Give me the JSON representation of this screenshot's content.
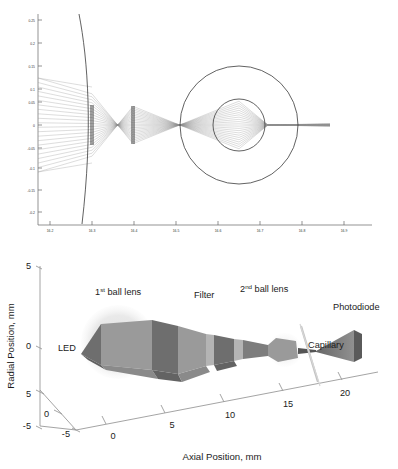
{
  "figure": {
    "name": "optical-ray-trace-and-3d-beam-layout",
    "background": "#ffffff"
  },
  "chart_data": [
    {
      "id": "ray-trace",
      "type": "line",
      "title": "",
      "xlabel": "",
      "ylabel": "",
      "xlim": [
        16.15,
        16.95
      ],
      "ylim": [
        -0.235,
        0.268
      ],
      "grid": false,
      "legend": null,
      "xticks": [
        "16.2",
        "16.3",
        "16.4",
        "16.5",
        "16.6",
        "16.7",
        "16.8",
        "16.9"
      ],
      "xtick_values": [
        16.2,
        16.3,
        16.4,
        16.5,
        16.6,
        16.7,
        16.8,
        16.9
      ],
      "yticks": [
        "0.25",
        "0.2",
        "0.15",
        "0.1",
        "0.05",
        "0",
        "-0.05",
        "-0.1",
        "-0.15",
        "-0.2"
      ],
      "ytick_values": [
        0.25,
        0.2,
        0.15,
        0.1,
        0.05,
        0,
        -0.05,
        -0.1,
        -0.15,
        -0.2
      ],
      "elements": [
        {
          "name": "first-ball-lens-arc",
          "kind": "arc",
          "center_x": 16.12,
          "center_y": 0.0,
          "radius": 0.175
        },
        {
          "name": "aperture-1",
          "kind": "vertical-stop",
          "x": 16.3,
          "half_height": 0.048
        },
        {
          "name": "aperture-2",
          "kind": "vertical-stop",
          "x": 16.385,
          "half_height": 0.046
        },
        {
          "name": "second-ball-lens-outer",
          "kind": "circle",
          "center_x": 16.6,
          "center_y": 0.0,
          "radius": 0.152
        },
        {
          "name": "capillary-bore",
          "kind": "circle",
          "center_x": 16.6,
          "center_y": 0.0,
          "radius": 0.068
        },
        {
          "name": "ray-bundle",
          "kind": "rays",
          "count": 22,
          "source_half_height": 0.068,
          "focus_x": 16.66,
          "focus_y": 0.0
        }
      ]
    },
    {
      "id": "beam-layout-3d",
      "type": "line",
      "title": "",
      "xlabel": "Axial Position, mm",
      "ylabel": "Radial Position, mm",
      "zlabel": "",
      "grid": false,
      "legend": null,
      "xticks": [
        "0",
        "5",
        "10",
        "15",
        "20"
      ],
      "xtick_values": [
        0,
        5,
        10,
        15,
        20
      ],
      "yticks": [
        "5",
        "0",
        "-5"
      ],
      "ytick_values": [
        5,
        0,
        -5
      ],
      "zticks": [
        "5",
        "0",
        "-5"
      ],
      "ztick_values": [
        5,
        0,
        -5
      ],
      "annotations": [
        {
          "name": "led",
          "text": "LED",
          "x": 0.5,
          "y": -2.0
        },
        {
          "name": "first-ball-lens",
          "text": "1",
          "sup": "st",
          "text_rest": " ball lens",
          "x": 2.0,
          "y": 4.0
        },
        {
          "name": "filter",
          "text": "Filter",
          "x": 9.0,
          "y": 4.0
        },
        {
          "name": "second-ball-lens",
          "text": "2",
          "sup": "nd",
          "text_rest": " ball lens",
          "x": 14.0,
          "y": 4.2
        },
        {
          "name": "photodiode",
          "text": "Photodiode",
          "x": 21.5,
          "y": 1.5
        },
        {
          "name": "capillary",
          "text": "Capillary",
          "x": 18.5,
          "y": -2.0
        }
      ]
    }
  ],
  "labels": {
    "radial_axis_title": "Radial Position, mm",
    "axial_axis_title": "Axial Position, mm",
    "led": "LED",
    "first_ball_lens_num": "1",
    "first_ball_lens_sup": "st",
    "first_ball_lens_rest": " ball lens",
    "filter": "Filter",
    "second_ball_lens_num": "2",
    "second_ball_lens_sup": "nd",
    "second_ball_lens_rest": " ball lens",
    "photodiode": "Photodiode",
    "capillary": "Capillary"
  },
  "ticks_top": {
    "x": [
      "16.2",
      "16.3",
      "16.4",
      "16.5",
      "16.6",
      "16.7",
      "16.8",
      "16.9"
    ],
    "y": [
      "0.25",
      "0.2",
      "0.15",
      "0.1",
      "0.05",
      "0",
      "-0.05",
      "-0.1",
      "-0.15",
      "-0.2"
    ]
  },
  "ticks_bottom": {
    "axial": [
      "0",
      "5",
      "10",
      "15",
      "20"
    ],
    "depth": [
      "5",
      "0",
      "-5"
    ],
    "radial": [
      "5",
      "0",
      "-5"
    ]
  },
  "colors": {
    "background": "#ffffff",
    "ray": "#8d8d8d",
    "optic_outline": "#3a3a3a",
    "axis": "#9a9a9a",
    "beam_light": "#9a9a9a",
    "beam_dark": "#6e6e6e",
    "lens_halo": "#e6e6e6",
    "text": "#1b1b1b"
  }
}
